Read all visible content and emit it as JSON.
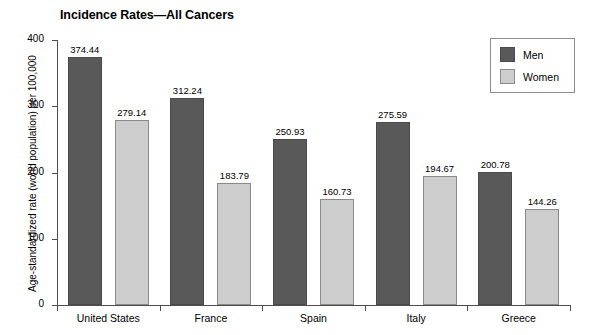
{
  "chart_data": {
    "type": "bar",
    "title": "Incidence Rates—All Cancers",
    "xlabel": "",
    "ylabel": "Age-standardized rate (world population) per 100,000",
    "ylim": [
      0,
      400
    ],
    "yticks": [
      "0",
      "100",
      "200",
      "300",
      "400"
    ],
    "grid": false,
    "legend_position": "top-right",
    "categories": [
      "United States",
      "France",
      "Spain",
      "Italy",
      "Greece"
    ],
    "series": [
      {
        "name": "Men",
        "color": "#595959",
        "values": [
          374.44,
          312.24,
          250.93,
          275.59,
          200.78
        ],
        "labels": [
          "374.44",
          "312.24",
          "250.93",
          "275.59",
          "200.78"
        ]
      },
      {
        "name": "Women",
        "color": "#cdcdcd",
        "values": [
          279.14,
          183.79,
          160.73,
          194.67,
          144.26
        ],
        "labels": [
          "279.14",
          "183.79",
          "160.73",
          "194.67",
          "144.26"
        ]
      }
    ]
  },
  "legend": {
    "items": [
      {
        "label": "Men"
      },
      {
        "label": "Women"
      }
    ]
  }
}
